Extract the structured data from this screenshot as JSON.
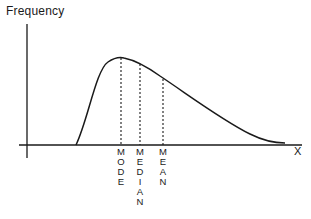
{
  "chart_data": {
    "type": "line",
    "title": "",
    "ylabel": "Frequency",
    "xlabel": "X",
    "grid": false,
    "legend": null,
    "markers": [
      {
        "name": "MODE",
        "order": 1,
        "position": "at peak of curve"
      },
      {
        "name": "MEDIAN",
        "order": 2,
        "position": "right of mode"
      },
      {
        "name": "MEAN",
        "order": 3,
        "position": "right of median"
      }
    ],
    "curve_shape": "right-skewed (long tail to the right)"
  },
  "axes": {
    "y_label": "Frequency",
    "x_label": "X"
  },
  "labels": {
    "mode": "MODE",
    "median": "MEDIAN",
    "mean": "MEAN"
  },
  "colors": {
    "line": "#1a1a1a",
    "background": "#ffffff"
  }
}
